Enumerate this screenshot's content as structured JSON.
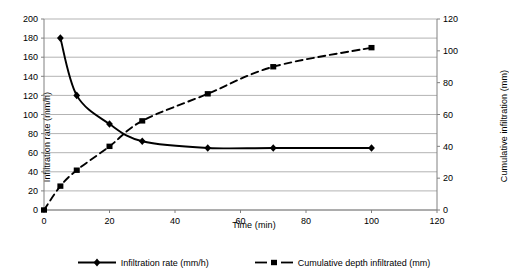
{
  "chart_data": {
    "type": "line",
    "title": "",
    "xlabel": "Time (min)",
    "ylabel": "Infiltration rate (mm/h)",
    "y2label": "Cumulative infiltration (mm)",
    "xlim": [
      0,
      120
    ],
    "ylim": [
      0,
      200
    ],
    "y2lim": [
      0,
      120
    ],
    "xticks": [
      0,
      20,
      40,
      60,
      80,
      100,
      120
    ],
    "yticks": [
      0,
      20,
      40,
      60,
      80,
      100,
      120,
      140,
      160,
      180,
      200
    ],
    "y2ticks": [
      0,
      20,
      40,
      60,
      80,
      100,
      120
    ],
    "grid": true,
    "legend_position": "bottom",
    "series": [
      {
        "name": "Infiltration rate (mm/h)",
        "axis": "left",
        "marker": "diamond",
        "linestyle": "solid",
        "color": "#000000",
        "x": [
          5,
          10,
          20,
          30,
          50,
          70,
          100
        ],
        "values": [
          180,
          120,
          90,
          72,
          65,
          65,
          65
        ]
      },
      {
        "name": "Cumulative depth infiltrated (mm)",
        "axis": "right",
        "marker": "square",
        "linestyle": "dashed",
        "color": "#000000",
        "x": [
          0,
          5,
          10,
          20,
          30,
          50,
          70,
          100
        ],
        "values": [
          0,
          15,
          25,
          40,
          56,
          73,
          90,
          102
        ]
      }
    ]
  },
  "axes": {
    "x_title": "Time (min)",
    "y_left_title": "Infiltration rate (mm/h)",
    "y_right_title": "Cumulative infiltration (mm)"
  },
  "legend": {
    "items": [
      {
        "label": "Infiltration rate (mm/h)",
        "marker": "diamond",
        "style": "solid"
      },
      {
        "label": "Cumulative depth infiltrated (mm)",
        "marker": "square",
        "style": "dashed"
      }
    ]
  },
  "colors": {
    "line": "#000000",
    "grid": "#b3b3b3",
    "axis": "#808080",
    "background": "#ffffff"
  }
}
